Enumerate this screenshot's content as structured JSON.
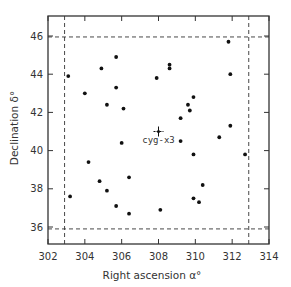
{
  "chart_data": {
    "type": "scatter",
    "title": "",
    "xlabel": "Right ascension  α°",
    "ylabel": "Declination  δ°",
    "xlim": [
      302,
      314
    ],
    "ylim": [
      35,
      47
    ],
    "x_ticks": [
      302,
      304,
      306,
      308,
      310,
      312,
      314
    ],
    "y_ticks": [
      36,
      38,
      40,
      42,
      44,
      46
    ],
    "grid": false,
    "legend": null,
    "boundary_box": {
      "style": "dashed",
      "alpha_min": 302.9,
      "alpha_max": 312.9,
      "delta_min": 35.9,
      "delta_max": 45.95
    },
    "series": [
      {
        "name": "sources",
        "marker": "dot",
        "points": [
          {
            "x": 303.1,
            "y": 43.9
          },
          {
            "x": 304.0,
            "y": 43.0
          },
          {
            "x": 304.9,
            "y": 44.3
          },
          {
            "x": 305.7,
            "y": 44.9
          },
          {
            "x": 305.7,
            "y": 43.3
          },
          {
            "x": 305.2,
            "y": 42.4
          },
          {
            "x": 306.1,
            "y": 42.2
          },
          {
            "x": 306.0,
            "y": 40.4
          },
          {
            "x": 307.9,
            "y": 43.8
          },
          {
            "x": 308.6,
            "y": 44.5
          },
          {
            "x": 308.6,
            "y": 44.3
          },
          {
            "x": 309.9,
            "y": 42.8
          },
          {
            "x": 309.6,
            "y": 42.4
          },
          {
            "x": 309.7,
            "y": 42.1
          },
          {
            "x": 309.2,
            "y": 41.7
          },
          {
            "x": 311.8,
            "y": 45.7
          },
          {
            "x": 311.9,
            "y": 44.0
          },
          {
            "x": 311.9,
            "y": 41.3
          },
          {
            "x": 311.3,
            "y": 40.7
          },
          {
            "x": 309.2,
            "y": 40.5
          },
          {
            "x": 309.9,
            "y": 39.8
          },
          {
            "x": 312.7,
            "y": 39.8
          },
          {
            "x": 310.4,
            "y": 38.2
          },
          {
            "x": 309.9,
            "y": 37.5
          },
          {
            "x": 310.2,
            "y": 37.3
          },
          {
            "x": 308.1,
            "y": 36.9
          },
          {
            "x": 304.2,
            "y": 39.4
          },
          {
            "x": 304.8,
            "y": 38.4
          },
          {
            "x": 305.2,
            "y": 37.9
          },
          {
            "x": 306.4,
            "y": 38.6
          },
          {
            "x": 305.7,
            "y": 37.1
          },
          {
            "x": 306.4,
            "y": 36.7
          },
          {
            "x": 303.2,
            "y": 37.6
          }
        ]
      }
    ],
    "annotations": [
      {
        "label": "cyg-x3",
        "x": 308.0,
        "y": 41.0,
        "marker": "cross"
      }
    ]
  },
  "labels": {
    "x_title": "Right ascension  α°",
    "y_title": "Declination  δ°",
    "annotation": "cyg-x3"
  }
}
